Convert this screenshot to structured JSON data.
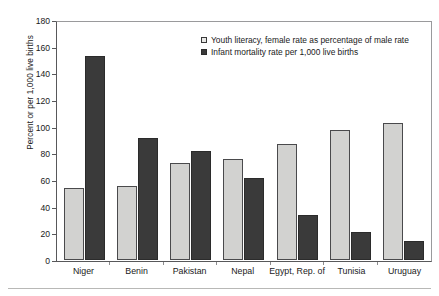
{
  "chart_data": {
    "type": "bar",
    "title": "",
    "xlabel": "",
    "ylabel": "Percent or per 1,000 live births",
    "ylim": [
      0,
      180
    ],
    "ytick_step": 20,
    "yticks": [
      180,
      160,
      140,
      120,
      100,
      80,
      60,
      40,
      20,
      0
    ],
    "grid": false,
    "legend_position": "top-right-inside",
    "categories": [
      "Niger",
      "Benin",
      "Pakistan",
      "Nepal",
      "Egypt, Rep. of",
      "Tunisia",
      "Uruguay"
    ],
    "series": [
      {
        "name": "Youth literacy, female rate as percentage of male rate",
        "color": "#d2d2d0",
        "values": [
          54,
          56,
          73,
          76,
          87,
          98,
          103
        ]
      },
      {
        "name": "Infant mortality rate per 1,000 live births",
        "color": "#3a3a3a",
        "values": [
          154,
          92,
          82,
          62,
          34,
          21,
          14
        ]
      }
    ]
  },
  "axis": {
    "y_title": "Percent or per 1,000 live births"
  },
  "legend": {
    "items": [
      {
        "label": "Youth literacy, female rate as percentage of male rate",
        "marker": "open-square-marker"
      },
      {
        "label": "Infant mortality rate per 1,000 live births",
        "marker": "filled-square-marker"
      }
    ]
  },
  "colors": {
    "series_literacy": "#d2d2d0",
    "series_mortality": "#3a3a3a",
    "axis": "#58585a",
    "frame": "#9a9a9c",
    "text": "#1a1a1a"
  }
}
